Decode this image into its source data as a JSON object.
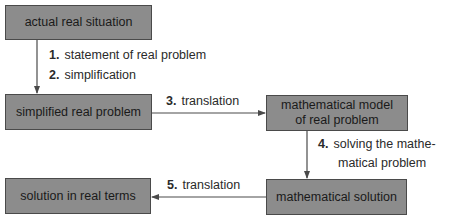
{
  "diagram": {
    "nodes": [
      {
        "id": "actual",
        "label": "actual real situation"
      },
      {
        "id": "simplified",
        "label": "simplified real problem"
      },
      {
        "id": "model",
        "label_line1": "mathematical model",
        "label_line2": "of real problem"
      },
      {
        "id": "math_solution",
        "label": "mathematical solution"
      },
      {
        "id": "real_solution",
        "label": "solution in real terms"
      }
    ],
    "steps": [
      {
        "num": "1.",
        "text": "statement of real problem"
      },
      {
        "num": "2.",
        "text": "simplification"
      },
      {
        "num": "3.",
        "text": "translation"
      },
      {
        "num": "4.",
        "text_line1": "solving the mathe-",
        "text_line2": "matical problem"
      },
      {
        "num": "5.",
        "text": "translation"
      }
    ],
    "colors": {
      "box_fill": "#8c8c8c",
      "box_border": "#4a4a4a",
      "arrow": "#4a4a4a",
      "text": "#1e1e1e"
    }
  }
}
